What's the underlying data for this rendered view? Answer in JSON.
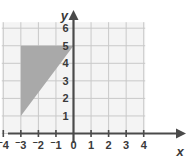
{
  "chart_data": {
    "type": "scatter",
    "title": "",
    "xlabel": "x",
    "ylabel": "y",
    "xlim": [
      -4,
      4
    ],
    "ylim": [
      0,
      6
    ],
    "grid": true,
    "legend": null,
    "x_ticks": [
      "-4",
      "-3",
      "-2",
      "-1",
      "0",
      "1",
      "2",
      "3",
      "4"
    ],
    "x_tick_values": [
      -4,
      -3,
      -2,
      -1,
      0,
      1,
      2,
      3,
      4
    ],
    "x_tick_display": [
      {
        "sign": "⁻",
        "digit": "4"
      },
      {
        "sign": "⁻",
        "digit": "3"
      },
      {
        "sign": "⁻",
        "digit": "2"
      },
      {
        "sign": "⁻",
        "digit": "1"
      },
      {
        "sign": "",
        "digit": "0"
      },
      {
        "sign": "",
        "digit": "1"
      },
      {
        "sign": "",
        "digit": "2"
      },
      {
        "sign": "",
        "digit": "3"
      },
      {
        "sign": "",
        "digit": "4"
      }
    ],
    "y_ticks": [
      "1",
      "2",
      "3",
      "4",
      "5",
      "6"
    ],
    "y_tick_values": [
      1,
      2,
      3,
      4,
      5,
      6
    ],
    "shapes": [
      {
        "name": "shaded-triangle",
        "type": "polygon",
        "vertices": [
          [
            -3,
            5
          ],
          [
            0,
            5
          ],
          [
            -3,
            1
          ]
        ],
        "fill": "#a9a9a9",
        "label": ""
      }
    ],
    "colors": {
      "axis": "#4a4a4a",
      "grid": "#c9c9c9",
      "plot_background": "#f4f4f4",
      "shape_fill": "#a9a9a9",
      "text": "#3a3a3a"
    }
  },
  "axes": {
    "y_label": "y",
    "x_label": "x"
  }
}
